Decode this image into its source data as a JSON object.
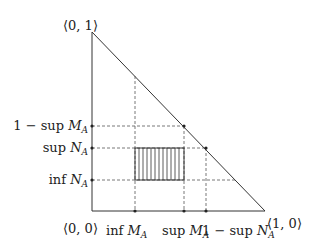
{
  "diagram": {
    "vertices": {
      "origin": "⟨0, 0⟩",
      "top": "⟨0, 1⟩",
      "right": "⟨1, 0⟩"
    },
    "y_labels": {
      "one_minus_sup_M": {
        "prefix": "1 − sup ",
        "var": "M",
        "sub": "A"
      },
      "sup_N": {
        "prefix": "sup ",
        "var": "N",
        "sub": "A"
      },
      "inf_N": {
        "prefix": "inf ",
        "var": "N",
        "sub": "A"
      }
    },
    "x_labels": {
      "inf_M": {
        "prefix": "inf ",
        "var": "M",
        "sub": "A"
      },
      "sup_M": {
        "prefix": "sup ",
        "var": "M",
        "sub": "A"
      },
      "one_minus_sup_N": {
        "prefix": "1 − sup ",
        "var": "N",
        "sub": "A"
      }
    },
    "colors": {
      "line": "#333333",
      "dashed": "#555555",
      "background": "#ffffff"
    }
  }
}
